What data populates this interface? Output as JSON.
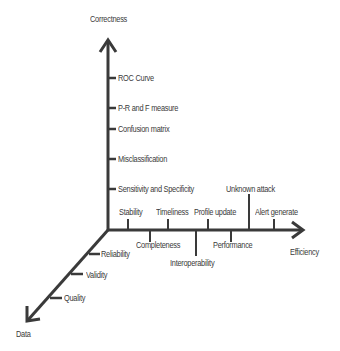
{
  "diagram": {
    "axes": {
      "vertical": {
        "label": "Correctness"
      },
      "horizontal": {
        "label": "Efficiency"
      },
      "diagonal": {
        "label": "Data"
      }
    },
    "correctness_items": [
      "ROC Curve",
      "P-R and F measure",
      "Confusion matrix",
      "Misclassification",
      "Sensitivity and Specificity"
    ],
    "efficiency_items_above": [
      "Stability",
      "Timeliness",
      "Profile update",
      "Unknown attack",
      "Alert generate"
    ],
    "efficiency_items_below": [
      "Completeness",
      "Interoperability",
      "Performance"
    ],
    "data_items": [
      "Reliability",
      "Validity",
      "Quality"
    ],
    "colors": {
      "axis": "#3a3a3a",
      "text": "#3a3a3a",
      "background": "#ffffff"
    }
  }
}
